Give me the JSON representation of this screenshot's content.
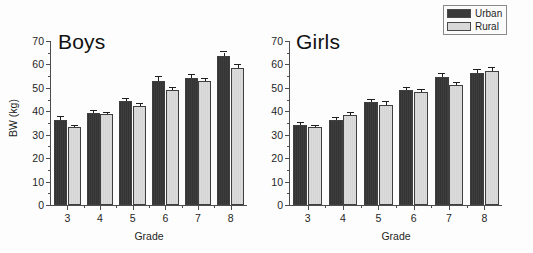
{
  "chart_data": {
    "type": "bar",
    "title": "",
    "panels": [
      {
        "title": "Boys",
        "xlabel": "Grade",
        "ylabel": "BW (kg)",
        "ylim": [
          0,
          70
        ],
        "ytick_step": 10,
        "yticks": [
          0,
          10,
          20,
          30,
          40,
          50,
          60,
          70
        ],
        "categories": [
          "3",
          "4",
          "5",
          "6",
          "7",
          "8"
        ],
        "series": [
          {
            "name": "Urban",
            "color": "#3a3a3a",
            "values": [
              36.5,
              39.2,
              44.3,
              53.0,
              54.2,
              63.8
            ],
            "errors": [
              1.0,
              0.8,
              0.9,
              1.5,
              1.2,
              1.3
            ]
          },
          {
            "name": "Rural",
            "color": "#d8d8d8",
            "values": [
              33.1,
              38.7,
              42.3,
              49.0,
              52.8,
              58.6
            ],
            "errors": [
              0.7,
              0.7,
              0.7,
              0.9,
              1.0,
              1.0
            ]
          }
        ]
      },
      {
        "title": "Girls",
        "xlabel": "Grade",
        "ylabel": "",
        "ylim": [
          0,
          70
        ],
        "ytick_step": 10,
        "yticks": [
          0,
          10,
          20,
          30,
          40,
          50,
          60,
          70
        ],
        "categories": [
          "3",
          "4",
          "5",
          "6",
          "7",
          "8"
        ],
        "series": [
          {
            "name": "Urban",
            "color": "#3a3a3a",
            "values": [
              34.3,
              36.2,
              43.9,
              49.2,
              54.8,
              56.3
            ],
            "errors": [
              0.8,
              0.9,
              1.0,
              0.9,
              1.1,
              1.2
            ]
          },
          {
            "name": "Rural",
            "color": "#d8d8d8",
            "values": [
              33.1,
              38.4,
              42.7,
              48.4,
              51.2,
              57.2
            ],
            "errors": [
              0.7,
              0.8,
              1.1,
              0.7,
              0.9,
              1.2
            ]
          }
        ]
      }
    ],
    "legend": {
      "position": "top-right",
      "entries": [
        {
          "label": "Urban",
          "color": "#3a3a3a"
        },
        {
          "label": "Rural",
          "color": "#d8d8d8"
        }
      ]
    },
    "grid": false
  }
}
